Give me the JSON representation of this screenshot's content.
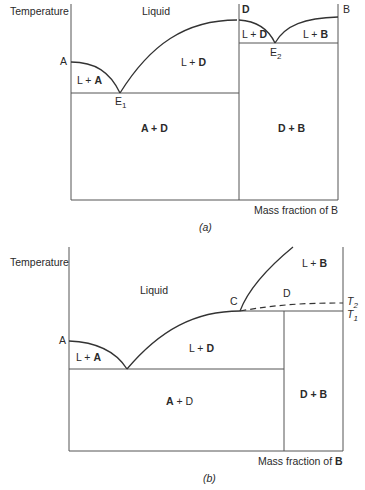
{
  "panel_a": {
    "y_axis_label": "Temperature",
    "x_axis_label": "Mass fraction of B",
    "caption_letter": "a",
    "point_labels": {
      "A": "A",
      "D": "D",
      "B": "B",
      "E1": "E",
      "E1_sub": "1",
      "E2": "E",
      "E2_sub": "2"
    },
    "regions": {
      "liquid": "Liquid",
      "l_plus_a": {
        "l": "L + ",
        "solid": "A"
      },
      "l_plus_d_left": {
        "l": "L + ",
        "solid": "D"
      },
      "l_plus_d_right": {
        "l": "L + ",
        "solid": "D"
      },
      "l_plus_b": {
        "l": "L + ",
        "solid": "B"
      },
      "a_plus_d": "A + D",
      "d_plus_b": "D + B"
    }
  },
  "panel_b": {
    "y_axis_label": "Temperature",
    "x_axis_label_prefix": "Mass fraction of ",
    "x_axis_label_bold": "B",
    "caption_letter": "b",
    "point_labels": {
      "A": "A",
      "C": "C",
      "D": "D",
      "T2": "T",
      "T2_sub": "2",
      "T1": "T",
      "T1_sub": "1"
    },
    "regions": {
      "liquid": "Liquid",
      "l_plus_a": {
        "l": "L + ",
        "solid": "A"
      },
      "l_plus_d": {
        "l": "L + ",
        "solid": "D"
      },
      "l_plus_b": {
        "l": "L + ",
        "solid": "B"
      },
      "a_plus_d": {
        "solid": "A",
        "rest": " + D"
      },
      "d_plus_b": "D + B"
    }
  },
  "colors": {
    "line": "#555555",
    "text": "#2a2a2a"
  }
}
